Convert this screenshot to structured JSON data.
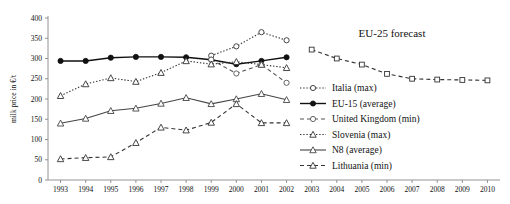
{
  "chart_data": {
    "type": "line",
    "title": "",
    "xlabel": "",
    "ylabel": "milk price in €/t",
    "xlim": [
      1992.5,
      2010.5
    ],
    "ylim": [
      0,
      400
    ],
    "ytick_step": 50,
    "grid": false,
    "legend_position": "right",
    "x": [
      1993,
      1994,
      1995,
      1996,
      1997,
      1998,
      1999,
      2000,
      2001,
      2002,
      2003,
      2004,
      2005,
      2006,
      2007,
      2008,
      2009,
      2010
    ],
    "xticks": [
      "1993",
      "1994",
      "1995",
      "1996",
      "1997",
      "1998",
      "1999",
      "2000",
      "2001",
      "2002",
      "2003",
      "2004",
      "2005",
      "2006",
      "2007",
      "2008",
      "2009",
      "2010"
    ],
    "yticks": [
      "0",
      "50",
      "100",
      "150",
      "200",
      "250",
      "300",
      "350",
      "400"
    ],
    "annotations": [
      {
        "text": "EU-25 forecast",
        "x": 2006.2,
        "y": 352
      }
    ],
    "series": [
      {
        "name": "Italia (max)",
        "label": "Italia (max)",
        "marker": "circle-open",
        "line": "dotted",
        "color": "#333333",
        "x": [
          1999,
          2000,
          2001,
          2002
        ],
        "values": [
          307,
          330,
          365,
          345
        ]
      },
      {
        "name": "EU-15 (average)",
        "label": "EU-15 (average)",
        "marker": "circle-filled",
        "line": "solid",
        "color": "#111111",
        "x": [
          1993,
          1994,
          1995,
          1996,
          1997,
          1998,
          1999,
          2000,
          2001,
          2002
        ],
        "values": [
          294,
          294,
          302,
          304,
          304,
          303,
          297,
          286,
          294,
          303
        ]
      },
      {
        "name": "United Kingdom (min)",
        "label": "United Kingdom (min)",
        "marker": "circle-open",
        "line": "dashed",
        "color": "#555555",
        "x": [
          1999,
          2000,
          2001,
          2002
        ],
        "values": [
          297,
          263,
          285,
          240
        ]
      },
      {
        "name": "Slovenia (max)",
        "label": "Slovenia (max)",
        "marker": "triangle-open",
        "line": "dotted",
        "color": "#333333",
        "x": [
          1993,
          1994,
          1995,
          1996,
          1997,
          1998,
          1999,
          2000,
          2001,
          2002
        ],
        "values": [
          208,
          237,
          252,
          243,
          265,
          294,
          286,
          292,
          285,
          277
        ]
      },
      {
        "name": "N8 (average)",
        "label": "N8 (average)",
        "marker": "triangle-open",
        "line": "solid",
        "color": "#444444",
        "x": [
          1993,
          1994,
          1995,
          1996,
          1997,
          1998,
          1999,
          2000,
          2001,
          2002
        ],
        "values": [
          140,
          152,
          171,
          177,
          189,
          203,
          188,
          200,
          213,
          198
        ]
      },
      {
        "name": "Lithuania (min)",
        "label": "Lithuania (min)",
        "marker": "triangle-open",
        "line": "dashed",
        "color": "#333333",
        "x": [
          1993,
          1994,
          1995,
          1996,
          1997,
          1998,
          1999,
          2000,
          2001,
          2002
        ],
        "values": [
          52,
          55,
          57,
          92,
          130,
          123,
          142,
          188,
          141,
          141
        ]
      },
      {
        "name": "EU-25 forecast",
        "label": "EU-25 forecast",
        "marker": "square-open",
        "line": "dashed",
        "color": "#333333",
        "x": [
          2003,
          2004,
          2005,
          2006,
          2007,
          2008,
          2009,
          2010
        ],
        "values": [
          322,
          300,
          285,
          262,
          250,
          248,
          247,
          246
        ]
      }
    ]
  },
  "legend": {
    "items": [
      {
        "label": "Italia (max)"
      },
      {
        "label": "EU-15 (average)"
      },
      {
        "label": "United Kingdom (min)"
      },
      {
        "label": "Slovenia (max)"
      },
      {
        "label": "N8 (average)"
      },
      {
        "label": "Lithuania (min)"
      }
    ]
  }
}
